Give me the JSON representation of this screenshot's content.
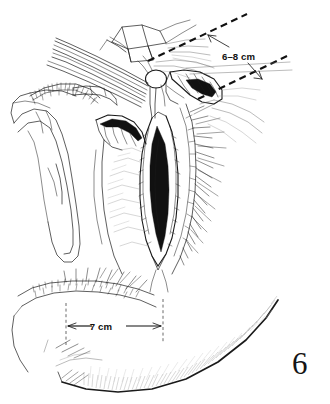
{
  "figure": {
    "number": "6",
    "kind": "surgical-line-illustration",
    "background_color": "#ffffff",
    "ink_color": "#1a1a1a",
    "width": 330,
    "height": 404
  },
  "annotations": {
    "incision_length": {
      "label": "6–8 cm",
      "name": "incision-length-dimension",
      "x": 222,
      "y": 60
    },
    "perineal_width": {
      "label": "7 cm",
      "name": "perineal-width-dimension",
      "x": 101,
      "y": 331
    }
  },
  "figure_number": {
    "label": "6",
    "x": 294,
    "y": 352
  }
}
